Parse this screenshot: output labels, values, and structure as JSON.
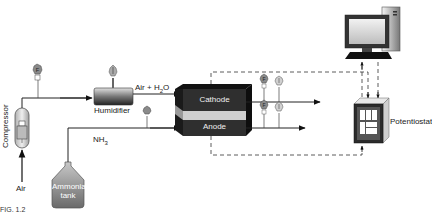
{
  "diagram": {
    "type": "fuel-cell-test-setup",
    "caption_fragment": "FIG. 1.2",
    "components": {
      "compressor": {
        "label": "Compressor"
      },
      "air_inlet": {
        "label": "Air"
      },
      "humidifier": {
        "label": "Humidifier"
      },
      "air_h2o_stream": {
        "label": "Air + H",
        "sub": "2",
        "suffix": "O"
      },
      "nh3_stream": {
        "label": "NH",
        "sub": "3"
      },
      "ammonia_tank": {
        "line1": "Ammonia",
        "line2": "tank"
      },
      "cathode": {
        "label": "Cathode"
      },
      "anode": {
        "label": "Anode"
      },
      "potentiostat": {
        "label": "Potentiostat"
      },
      "computer": {
        "label": ""
      }
    },
    "instruments": {
      "flow_meter_symbol": "F",
      "pressure_symbol": "P"
    },
    "colors": {
      "stack_dark": "#2a2a2a",
      "stack_band": "#d0d0d0",
      "gauge": "#8a8a8a",
      "tank": "#8e8e8e",
      "line": "#222222"
    }
  }
}
